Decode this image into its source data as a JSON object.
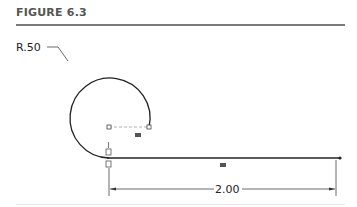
{
  "figure": {
    "title": "FIGURE 6.3"
  },
  "sketch": {
    "radius_label": "R.50",
    "length_label": "2.00",
    "colors": {
      "line": "#222222",
      "construction": "#888888",
      "title": "#555555"
    }
  }
}
